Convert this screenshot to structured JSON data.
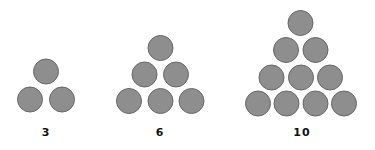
{
  "diagram": {
    "colors": {
      "circle_fill": "#8e8e8e",
      "circle_stroke": "#666666",
      "label": "#111111"
    },
    "circle_radius": 12.5,
    "groups": [
      {
        "label": "3",
        "label_x": 46,
        "label_y": 127,
        "rows": [
          {
            "y": 71.5,
            "x": [
              46
            ]
          },
          {
            "y": 99.5,
            "x": [
              30,
              62
            ]
          }
        ]
      },
      {
        "label": "6",
        "label_x": 160,
        "label_y": 127,
        "rows": [
          {
            "y": 48,
            "x": [
              160.5
            ]
          },
          {
            "y": 74.5,
            "x": [
              144.5,
              176
            ]
          },
          {
            "y": 101,
            "x": [
              129,
              160.5,
              191.5
            ]
          }
        ]
      },
      {
        "label": "10",
        "label_x": 302,
        "label_y": 127,
        "rows": [
          {
            "y": 23,
            "x": [
              300.5
            ]
          },
          {
            "y": 50,
            "x": [
              286,
              315.5
            ]
          },
          {
            "y": 77.5,
            "x": [
              271.5,
              301,
              330
            ]
          },
          {
            "y": 103.5,
            "x": [
              258,
              286.5,
              315.5,
              344
            ]
          }
        ]
      }
    ]
  }
}
